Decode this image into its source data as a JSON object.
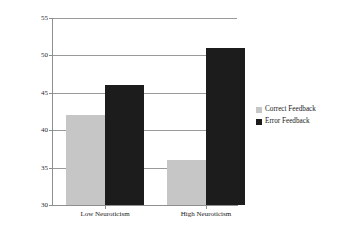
{
  "chart_data": {
    "type": "bar",
    "title": "",
    "xlabel": "",
    "ylabel": "Percentage of Switched Responses Across Trials",
    "categories": [
      "Low Neuroticism",
      "High Neuroticism"
    ],
    "series": [
      {
        "name": "Correct Feedback",
        "color": "#c6c6c6",
        "values": [
          42,
          36
        ]
      },
      {
        "name": "Error Feedback",
        "color": "#1c1c1c",
        "values": [
          46,
          51
        ]
      }
    ],
    "ylim": [
      30,
      55
    ],
    "yticks": [
      30,
      35,
      40,
      45,
      50,
      55
    ],
    "ytick_labels": [
      "30",
      "35",
      "40",
      "45",
      "50",
      "55"
    ],
    "grid": true,
    "legend_position": "right"
  },
  "legend": {
    "entries": [
      {
        "label": "Correct Feedback",
        "swatch": "#c6c6c6"
      },
      {
        "label": "Error Feedback",
        "swatch": "#1c1c1c"
      }
    ]
  }
}
